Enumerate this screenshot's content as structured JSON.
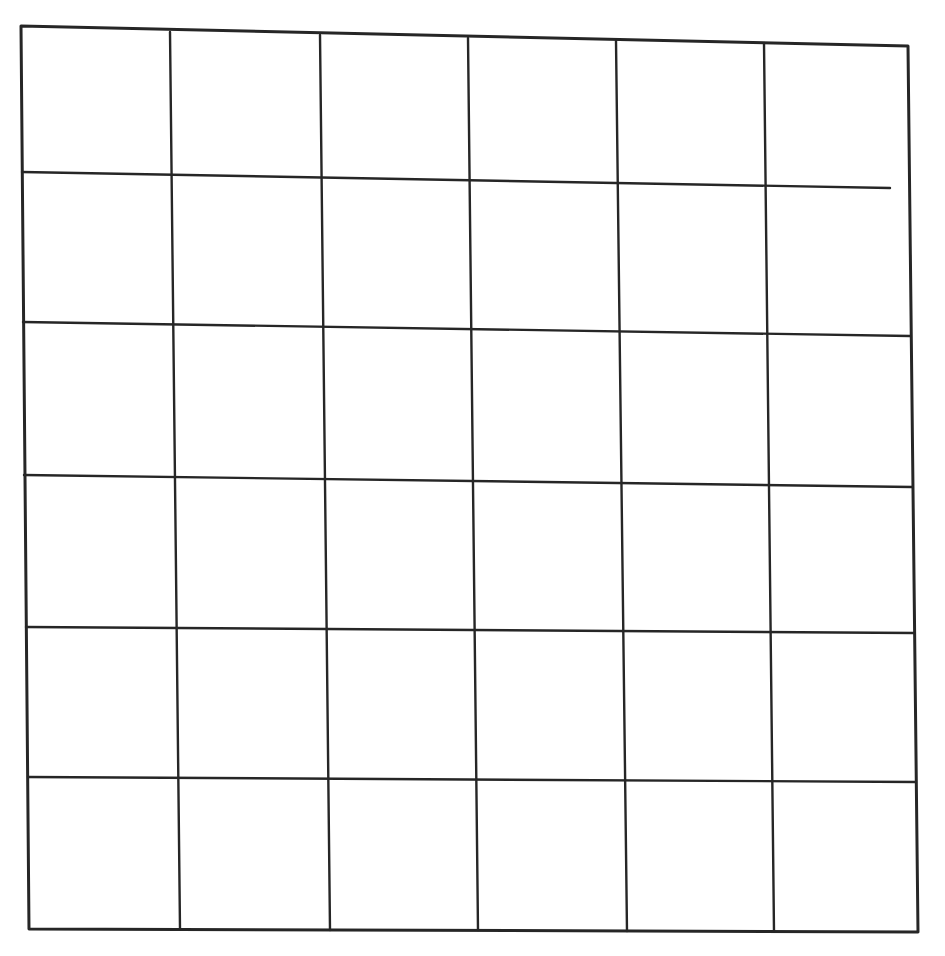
{
  "diagram": {
    "type": "grid",
    "rows": 6,
    "columns": 6,
    "style": "hand-drawn scanned sketch",
    "line_color": "#262626",
    "background_color": "#ffffff",
    "outer_border": {
      "top_left": [
        21,
        26
      ],
      "top_right": [
        908,
        46
      ],
      "bottom_right": [
        918,
        932
      ],
      "bottom_left": [
        29,
        929
      ]
    },
    "vertical_lines": [
      {
        "top": [
          170,
          32
        ],
        "bottom": [
          180,
          929
        ]
      },
      {
        "top": [
          320,
          35
        ],
        "bottom": [
          330,
          930
        ]
      },
      {
        "top": [
          468,
          38
        ],
        "bottom": [
          478,
          930
        ]
      },
      {
        "top": [
          616,
          41
        ],
        "bottom": [
          627,
          931
        ]
      },
      {
        "top": [
          764,
          43
        ],
        "bottom": [
          774,
          931
        ]
      }
    ],
    "horizontal_lines": [
      {
        "left": [
          22,
          172
        ],
        "right": [
          890,
          188
        ]
      },
      {
        "left": [
          23,
          322
        ],
        "right": [
          910,
          336
        ]
      },
      {
        "left": [
          24,
          475
        ],
        "right": [
          912,
          487
        ]
      },
      {
        "left": [
          26,
          627
        ],
        "right": [
          914,
          633
        ]
      },
      {
        "left": [
          28,
          777
        ],
        "right": [
          916,
          782
        ]
      }
    ]
  }
}
